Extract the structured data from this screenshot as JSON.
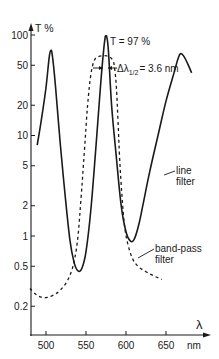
{
  "chart_data": {
    "type": "line",
    "title": "",
    "xlabel": "λ",
    "xunit": "nm",
    "ylabel": "T %",
    "yscale": "log",
    "ylim": [
      0.12,
      110
    ],
    "xlim": [
      480,
      690
    ],
    "grid": false,
    "yticks": [
      100,
      50,
      20,
      10,
      5,
      2,
      1,
      0.5,
      0.2
    ],
    "ytick_labels": [
      "100",
      "50",
      "20",
      "10",
      "5",
      "2",
      "1",
      "0.5",
      "0.2"
    ],
    "xticks": [
      500,
      550,
      600,
      650
    ],
    "xtick_labels": [
      "500",
      "550",
      "600",
      "650"
    ],
    "series": [
      {
        "name": "line filter",
        "style": "solid",
        "x": [
          489,
          494,
          500,
          504,
          506,
          508,
          512,
          518,
          524,
          530,
          535,
          540,
          545,
          550,
          556,
          562,
          568,
          572,
          574,
          575,
          576,
          578,
          582,
          588,
          594,
          600,
          605,
          610,
          616,
          622,
          630,
          640,
          650,
          660,
          665,
          668,
          672,
          678,
          682
        ],
        "y": [
          8,
          14,
          30,
          60,
          70,
          62,
          30,
          8,
          2.5,
          0.9,
          0.55,
          0.45,
          0.48,
          0.7,
          1.8,
          7,
          30,
          70,
          95,
          97,
          95,
          70,
          20,
          6,
          2.0,
          1.1,
          0.9,
          0.92,
          1.3,
          2.2,
          4.5,
          10,
          22,
          42,
          58,
          65,
          62,
          50,
          42
        ]
      },
      {
        "name": "band-pass filter",
        "style": "dashed",
        "x": [
          480,
          488,
          495,
          502,
          510,
          518,
          526,
          532,
          536,
          540,
          544,
          548,
          552,
          556,
          560,
          564,
          570,
          576,
          580,
          584,
          586,
          588,
          590,
          592,
          595,
          598,
          602,
          608,
          615,
          625,
          635,
          645
        ],
        "y": [
          0.3,
          0.26,
          0.245,
          0.245,
          0.26,
          0.29,
          0.35,
          0.45,
          0.6,
          1.0,
          2.5,
          7,
          20,
          40,
          55,
          60,
          62,
          62,
          60,
          55,
          45,
          30,
          14,
          6,
          2.5,
          1.3,
          0.85,
          0.6,
          0.5,
          0.44,
          0.4,
          0.37
        ]
      }
    ],
    "annotations": [
      {
        "text": "T = 97 %",
        "x": 575,
        "y": 97
      },
      {
        "text": "Δλ1/2 = 3.6 nm",
        "x": 576,
        "y": 50
      },
      {
        "text": "line filter",
        "x": 630,
        "y": 4.5
      },
      {
        "text": "band-pass filter",
        "x": 612,
        "y": 0.55
      }
    ]
  },
  "labels": {
    "y_axis": "T %",
    "x_axis": "λ",
    "x_unit": "nm",
    "peak": "T = 97 %",
    "fwhm_prefix": "Δλ",
    "fwhm_sub": "1/2",
    "fwhm_value": "= 3.6 nm",
    "line_filter_1": "line",
    "line_filter_2": "filter",
    "bandpass_1": "band-pass",
    "bandpass_2": "filter"
  },
  "style": {
    "ink": "#1a1a1a",
    "background": "#ffffff"
  }
}
